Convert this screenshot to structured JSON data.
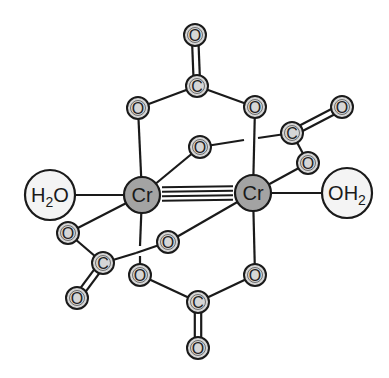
{
  "colors": {
    "background": "#ffffff",
    "bond": "#1a1a1a",
    "small_atom_fill": "#d6d6d6",
    "metal_fill": "#a3a3a3",
    "water_fill": "#f4f4f4",
    "outline": "#1a1a1a"
  },
  "atoms": [
    {
      "id": "O_top",
      "label": "O",
      "x": 195,
      "y": 35,
      "kind": "small"
    },
    {
      "id": "C_top",
      "label": "C",
      "x": 197,
      "y": 86,
      "kind": "small"
    },
    {
      "id": "O_tl",
      "label": "O",
      "x": 138,
      "y": 108,
      "kind": "small"
    },
    {
      "id": "O_tr",
      "label": "O",
      "x": 255,
      "y": 107,
      "kind": "small"
    },
    {
      "id": "O_ur",
      "label": "O",
      "x": 342,
      "y": 107,
      "kind": "small"
    },
    {
      "id": "C_right",
      "label": "C",
      "x": 292,
      "y": 133,
      "kind": "small"
    },
    {
      "id": "O_mid_up",
      "label": "O",
      "x": 200,
      "y": 147,
      "kind": "small"
    },
    {
      "id": "O_right_low",
      "label": "O",
      "x": 308,
      "y": 163,
      "kind": "small"
    },
    {
      "id": "Cr1",
      "label": "Cr",
      "x": 142,
      "y": 195,
      "kind": "metal"
    },
    {
      "id": "Cr2",
      "label": "Cr",
      "x": 253,
      "y": 193,
      "kind": "metal"
    },
    {
      "id": "H2O_left",
      "label": "H",
      "sub": "2",
      "tail": "O",
      "x": 50,
      "y": 195,
      "kind": "water"
    },
    {
      "id": "OH2_right",
      "label": "OH",
      "sub": "2",
      "tail": "",
      "x": 347,
      "y": 193,
      "kind": "water"
    },
    {
      "id": "O_left",
      "label": "O",
      "x": 68,
      "y": 233,
      "kind": "small"
    },
    {
      "id": "O_mid_low",
      "label": "O",
      "x": 168,
      "y": 242,
      "kind": "small"
    },
    {
      "id": "C_left",
      "label": "C",
      "x": 103,
      "y": 263,
      "kind": "small"
    },
    {
      "id": "O_bl",
      "label": "O",
      "x": 140,
      "y": 275,
      "kind": "small"
    },
    {
      "id": "O_br",
      "label": "O",
      "x": 255,
      "y": 275,
      "kind": "small"
    },
    {
      "id": "O_ll",
      "label": "O",
      "x": 77,
      "y": 298,
      "kind": "small"
    },
    {
      "id": "C_bottom",
      "label": "C",
      "x": 198,
      "y": 302,
      "kind": "small"
    },
    {
      "id": "O_bottom",
      "label": "O",
      "x": 198,
      "y": 348,
      "kind": "small"
    }
  ],
  "bonds": {
    "single": [
      [
        "C_top",
        "O_tl"
      ],
      [
        "C_top",
        "O_tr"
      ],
      [
        "O_tl",
        "Cr1"
      ],
      [
        "O_tr",
        "Cr2"
      ],
      [
        "Cr1",
        "O_mid_up"
      ],
      [
        "C_right",
        "O_right_low"
      ],
      [
        "O_right_low",
        "Cr2"
      ],
      [
        "Cr1",
        "H2O_left"
      ],
      [
        "Cr2",
        "OH2_right"
      ],
      [
        "Cr1",
        "O_left"
      ],
      [
        "O_left",
        "C_left"
      ],
      [
        "Cr2",
        "O_mid_low"
      ],
      [
        "O_bl",
        "C_bottom"
      ],
      [
        "O_br",
        "C_bottom"
      ],
      [
        "Cr2",
        "O_br"
      ]
    ],
    "double": [
      [
        "C_top",
        "O_top"
      ],
      [
        "C_right",
        "O_ur"
      ],
      [
        "C_left",
        "O_ll"
      ],
      [
        "C_bottom",
        "O_bottom"
      ]
    ],
    "broken": [
      {
        "from": "O_mid_up",
        "to": "C_right",
        "gap": [
          [
            244,
            140
          ],
          [
            258,
            138
          ]
        ]
      },
      {
        "from": "Cr1",
        "to": "O_bl",
        "gap": [
          [
            140,
            246
          ],
          [
            140,
            256
          ]
        ]
      },
      {
        "from": "C_left",
        "to": "O_mid_low",
        "gap": [
          [
            136,
            253
          ],
          [
            136,
            253
          ]
        ]
      }
    ],
    "quadruple": [
      "Cr1",
      "Cr2"
    ]
  },
  "labels": {
    "metal": "Cr",
    "water_left": "H2O",
    "water_right": "OH2"
  }
}
